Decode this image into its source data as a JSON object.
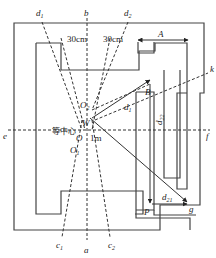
{
  "labels": {
    "d1_top": "d",
    "d1_top_sub": "1",
    "b": "b",
    "d2_top": "d",
    "d2_top_sub": "2",
    "cm30_left": "30cm",
    "cm30_right": "30cm",
    "A": "A",
    "k": "k",
    "B": "B",
    "O2": "O",
    "O2_sub": "2",
    "isocenter": "等中心",
    "W": "W",
    "O": "O",
    "O1": "O",
    "O1_sub": "1",
    "one_m": "1m",
    "d1_mid": "d",
    "d1_mid_sub": "1",
    "d22": "d",
    "d22_sub": "22",
    "e": "e",
    "f": "f",
    "P": "P",
    "d21": "d",
    "d21_sub": "21",
    "g": "g",
    "c1": "c",
    "c1_sub": "1",
    "a": "a",
    "c2": "c",
    "c2_sub": "2"
  },
  "colors": {
    "line": "#333333",
    "wall": "#444444",
    "background": "#ffffff"
  }
}
